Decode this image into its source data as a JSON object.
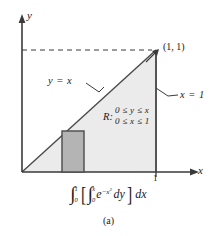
{
  "figure": {
    "caption": "(a)",
    "axes": {
      "y_label": "y",
      "x_label": "x",
      "x_tick_label": "1"
    },
    "annotations": {
      "corner_point": "(1, 1)",
      "line_equation": "y = x",
      "right_edge_equation": "x = 1"
    },
    "region": {
      "name": "R:",
      "constraint_y": "0 ≤ y ≤ x",
      "constraint_x": "0 ≤ x ≤ 1"
    },
    "integral": {
      "outer_upper": "1",
      "outer_lower": "0",
      "inner_upper": "x",
      "inner_lower": "0",
      "integrand_base": "e",
      "integrand_exponent": "−x",
      "integrand_exponent_power": "2",
      "inner_differential": "dy",
      "outer_differential": "dx",
      "bracket_open": "[",
      "bracket_close": "]",
      "integral_glyph": "∫"
    },
    "colors": {
      "triangle_fill": "#ebebeb",
      "strip_fill": "#b4b4b4",
      "stroke": "#3a3a3a",
      "background": "#ffffff"
    },
    "geometry": {
      "origin_x": 22,
      "origin_y": 172,
      "apex_x": 156,
      "apex_y": 50,
      "strip_left": 62,
      "strip_right": 84,
      "strip_top": 131
    }
  }
}
